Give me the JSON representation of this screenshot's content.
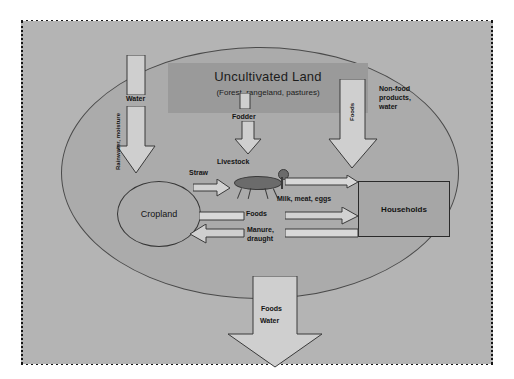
{
  "diagram": {
    "title": "Uncultivated Land",
    "subtitle": "(Forest, rangeland, pastures)",
    "nodes": {
      "cropland": "Cropland",
      "households": "Households",
      "livestock": "Livestock"
    },
    "flow_labels": {
      "water": "Water",
      "fodder": "Fodder",
      "foods_right_vertical": "Foods",
      "non_food_products": "Non-food\nproducts,\nwater",
      "straw": "Straw",
      "milk_meat_eggs": "Milk, meat, eggs",
      "foods_center": "Foods",
      "manure_draught": "Manure,\ndraught",
      "rainwater_moisture": "Rainwater, moisture",
      "outflow_foods": "Foods",
      "outflow_water": "Water"
    },
    "colors": {
      "panel_background": "#b4b4b4",
      "system_ellipse": "#ababab",
      "uncultivated_band": "#9a9a9a",
      "arrow_fill": "#cfcfcf",
      "arrow_stroke": "#3a3a3a",
      "node_stroke": "#2a2a2a",
      "text": "#141414",
      "frame_border": "#141414"
    }
  }
}
